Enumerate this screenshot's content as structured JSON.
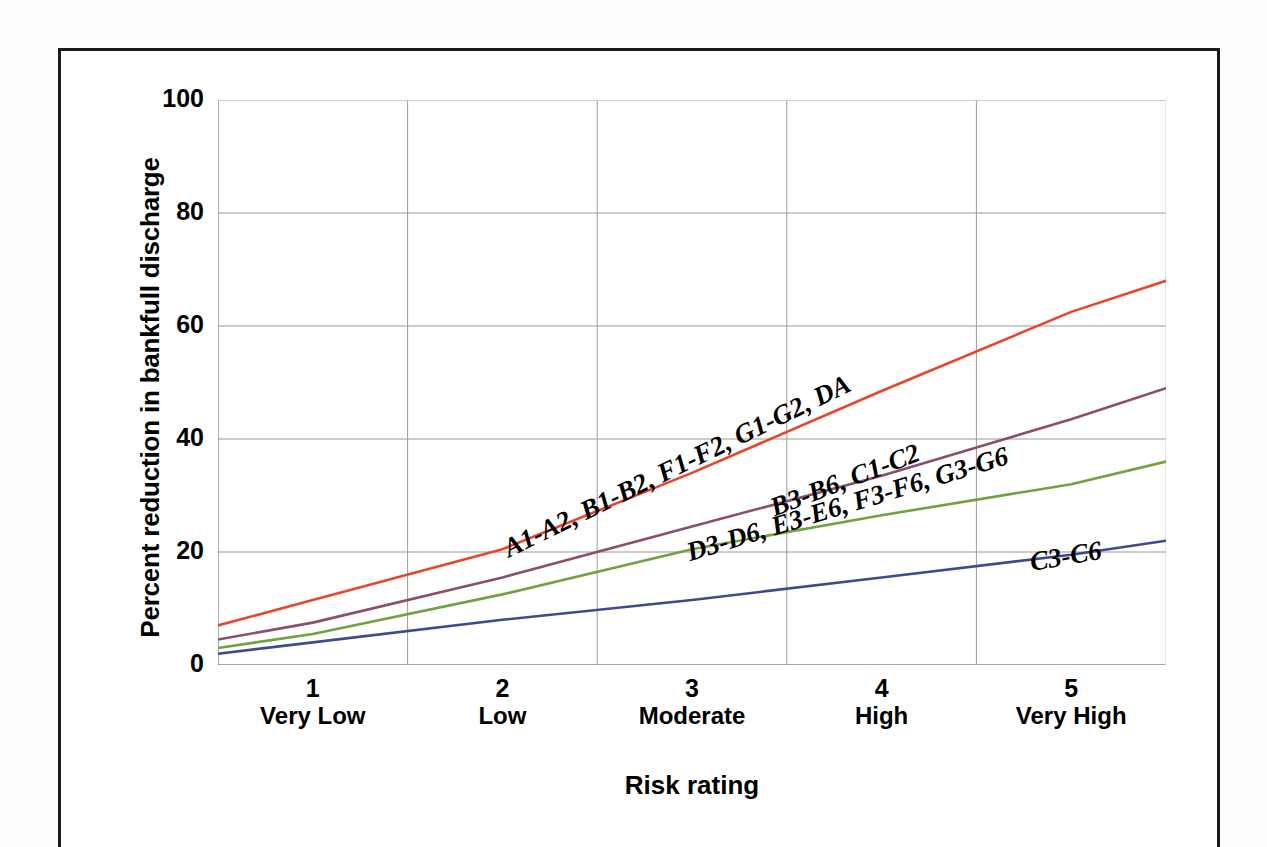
{
  "figure": {
    "ylabel": "Percent reduction in bankfull discharge",
    "xlabel": "Risk rating"
  },
  "chart_data": {
    "type": "line",
    "title": "",
    "xlabel": "Risk rating",
    "ylabel": "Percent reduction in bankfull discharge",
    "categories": [
      "1",
      "2",
      "3",
      "4",
      "5"
    ],
    "category_names": [
      "Very Low",
      "Low",
      "Moderate",
      "High",
      "Very High"
    ],
    "xtick_labels": [
      {
        "num": "1",
        "cat": "Very Low"
      },
      {
        "num": "2",
        "cat": "Low"
      },
      {
        "num": "3",
        "cat": "Moderate"
      },
      {
        "num": "4",
        "cat": "High"
      },
      {
        "num": "5",
        "cat": "Very High"
      }
    ],
    "ytick_labels": [
      "100",
      "80",
      "60",
      "40",
      "20",
      "0"
    ],
    "ylim": [
      0,
      100
    ],
    "ytick_values": [
      0,
      20,
      40,
      60,
      80,
      100
    ],
    "grid": true,
    "legend": "inline-labels",
    "series": [
      {
        "name": "A1-A2, B1-B2, F1-F2, G1-G2, DA",
        "color": "#E8452C",
        "x": [
          0.5,
          1,
          2,
          3,
          4,
          5,
          5.5
        ],
        "values": [
          7.0,
          11.5,
          20.5,
          34.0,
          48.5,
          62.5,
          68.0
        ],
        "label_angle": -26
      },
      {
        "name": "B3-B6, C1-C2",
        "color": "#8B4E6E",
        "x": [
          0.5,
          1,
          2,
          3,
          4,
          5,
          5.5
        ],
        "values": [
          4.5,
          7.5,
          15.5,
          24.5,
          33.5,
          43.5,
          49.0
        ],
        "label_angle": -21
      },
      {
        "name": "D3-D6, E3-E6, F3-F6, G3-G6",
        "color": "#70A340",
        "x": [
          0.5,
          1,
          2,
          3,
          4,
          5,
          5.5
        ],
        "values": [
          3.0,
          5.5,
          12.5,
          20.5,
          26.5,
          32.0,
          36.0
        ],
        "label_angle": -17
      },
      {
        "name": "C3-C6",
        "color": "#3D4B8C",
        "x": [
          0.5,
          1,
          2,
          3,
          4,
          5,
          5.5
        ],
        "values": [
          2.0,
          4.0,
          8.0,
          11.5,
          15.5,
          19.5,
          22.0
        ],
        "label_angle": -10
      }
    ]
  }
}
